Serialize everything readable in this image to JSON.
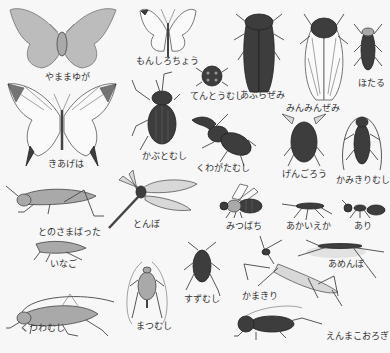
{
  "illustration": {
    "subject": "Japanese insect identification chart",
    "insects": [
      {
        "id": "yamamayuga",
        "label": "やままゆが"
      },
      {
        "id": "monshirochou",
        "label": "もんしろちょう"
      },
      {
        "id": "aburazemi",
        "label": "あぶらぜみ"
      },
      {
        "id": "minminzemi",
        "label": "みんみんぜみ"
      },
      {
        "id": "hotaru",
        "label": "ほたる"
      },
      {
        "id": "tentoumushi",
        "label": "てんとうむし"
      },
      {
        "id": "kiageha",
        "label": "きあげは"
      },
      {
        "id": "kabutomushi",
        "label": "かぶとむし"
      },
      {
        "id": "kuwagatamushi",
        "label": "くわがたむし"
      },
      {
        "id": "gengorou",
        "label": "げんごろう"
      },
      {
        "id": "kamikirimushi",
        "label": "かみきりむし"
      },
      {
        "id": "tonosamabatta",
        "label": "とのさまばった"
      },
      {
        "id": "tonbo",
        "label": "とんぼ"
      },
      {
        "id": "mitsubachi",
        "label": "みつばち"
      },
      {
        "id": "akaieka",
        "label": "あかいえか"
      },
      {
        "id": "ari",
        "label": "あり"
      },
      {
        "id": "inago",
        "label": "いなご"
      },
      {
        "id": "amenbo",
        "label": "あめんぼ"
      },
      {
        "id": "suzumushi",
        "label": "すずむし"
      },
      {
        "id": "kamakiri",
        "label": "かまきり"
      },
      {
        "id": "kutsuwamushi",
        "label": "くつわむし"
      },
      {
        "id": "matsumushi",
        "label": "まつむし"
      },
      {
        "id": "enmakoorogi",
        "label": "えんまこおろぎ"
      }
    ]
  }
}
